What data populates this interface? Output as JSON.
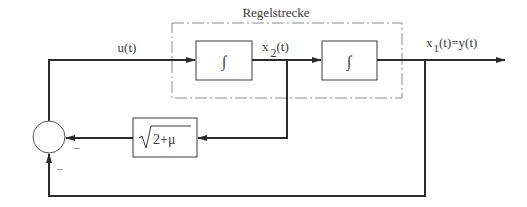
{
  "diagram": {
    "type": "control-loop-block-diagram",
    "plant_label": "Regelstrecke",
    "signals": {
      "input": "u(t)",
      "intermediate_x": "x",
      "intermediate_sub": "2",
      "intermediate_tail": "(t)",
      "output_x": "x",
      "output_sub": "1",
      "output_tail": "(t)=y(t)"
    },
    "blocks": [
      {
        "id": "integrator-1",
        "symbol": "∫"
      },
      {
        "id": "integrator-2",
        "symbol": "∫"
      },
      {
        "id": "feedback-gain",
        "symbol": "√",
        "expr": "2+μ"
      }
    ],
    "summing_junction": {
      "sign_feedback_gain": "–",
      "sign_output_feedback": "–"
    },
    "colors": {
      "line": "#2b2b2b",
      "dashed": "#8a8a8a",
      "text": "#3a3a3a"
    }
  }
}
